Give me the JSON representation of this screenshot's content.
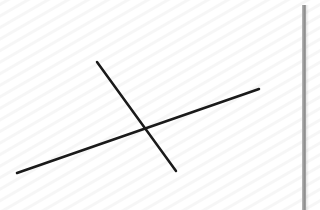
{
  "canvas": {
    "width": 320,
    "height": 210,
    "background": "#ffffff",
    "texture": "faint-diagonal-stripes"
  },
  "lines": [
    {
      "name": "steep-line",
      "x1": 97,
      "y1": 62,
      "x2": 176,
      "y2": 171,
      "stroke": "#1a1a1a",
      "width": 2.5
    },
    {
      "name": "shallow-line",
      "x1": 17,
      "y1": 173,
      "x2": 259,
      "y2": 89,
      "stroke": "#1a1a1a",
      "width": 2.5
    }
  ],
  "intersection": {
    "x": 146,
    "y": 127
  },
  "edge_bar": {
    "color": "#8e8e8e"
  }
}
